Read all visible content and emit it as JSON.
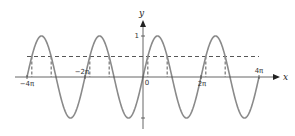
{
  "chart_data": {
    "type": "line",
    "title": "",
    "xlabel": "x",
    "ylabel": "y",
    "function": "y = sin x",
    "xlim_units_of_pi": [
      -4,
      4
    ],
    "ylim": [
      -1,
      1
    ],
    "grid": false,
    "legend": null,
    "x_tick_labels": [
      {
        "label": "−4π",
        "value_pi": -4
      },
      {
        "label": "−2π",
        "value_pi": -2
      },
      {
        "label": "0",
        "value_pi": 0
      },
      {
        "label": "2π",
        "value_pi": 2
      },
      {
        "label": "4π",
        "value_pi": 4
      }
    ],
    "y_tick_labels": [
      {
        "label": "1",
        "value": 1
      },
      {
        "label": "",
        "value": -1
      }
    ],
    "series": [
      {
        "name": "sin x",
        "style": "solid",
        "color": "#8a8a8a",
        "x_pi": [
          -4,
          -3.5,
          -3,
          -2.5,
          -2,
          -1.5,
          -1,
          -0.5,
          0,
          0.5,
          1,
          1.5,
          2,
          2.5,
          3,
          3.5,
          4
        ],
        "y": [
          0,
          1,
          0,
          -1,
          0,
          1,
          0,
          -1,
          0,
          1,
          0,
          -1,
          0,
          1,
          0,
          -1,
          0
        ]
      },
      {
        "name": "y = 0.5",
        "style": "dashed",
        "color": "#444444",
        "value": 0.5
      }
    ],
    "annotations": {
      "dashed_verticals_x_pi": [
        -3.8333,
        -3.1667,
        -1.8333,
        -1.1667,
        0.1667,
        0.8333,
        2.1667,
        2.8333
      ],
      "description": "Vertical dashed lines drop from intersections of y=sin x and y=0.5 to the x-axis"
    }
  },
  "colors": {
    "curve": "#8a8a8a",
    "axes": "#555555",
    "dashed": "#444444"
  }
}
